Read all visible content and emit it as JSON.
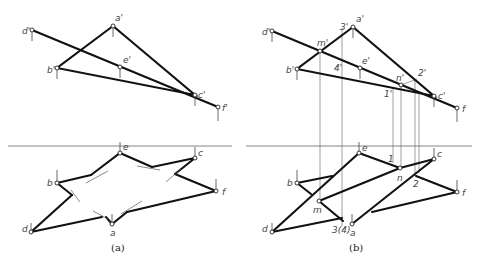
{
  "figure": {
    "panels": [
      {
        "id": "a",
        "caption": "(a)",
        "caption_pos": [
          120,
          250
        ],
        "divider": [
          8,
          146,
          232,
          146
        ],
        "top_view_label": "front",
        "points_top": {
          "d'": [
            32,
            30
          ],
          "a'": [
            113,
            26
          ],
          "b'": [
            57,
            68
          ],
          "e'": [
            120,
            67
          ],
          "c'": [
            195,
            95
          ],
          "f'": [
            218,
            107
          ]
        },
        "points_bottom": {
          "e": [
            120,
            153
          ],
          "c": [
            195,
            158
          ],
          "b": [
            57,
            183
          ],
          "f": [
            216,
            191
          ],
          "d": [
            31,
            232
          ],
          "a": [
            112,
            224
          ]
        },
        "labels_top": [
          {
            "text": "d'",
            "x": 22,
            "y": 34
          },
          {
            "text": "a'",
            "x": 115,
            "y": 21
          },
          {
            "text": "b'",
            "x": 47,
            "y": 73
          },
          {
            "text": "e'",
            "x": 123,
            "y": 63
          },
          {
            "text": "c'",
            "x": 198,
            "y": 98
          },
          {
            "text": "f'",
            "x": 222,
            "y": 111
          }
        ],
        "labels_bottom": [
          {
            "text": "e",
            "x": 123,
            "y": 150
          },
          {
            "text": "c",
            "x": 198,
            "y": 156
          },
          {
            "text": "b",
            "x": 47,
            "y": 186
          },
          {
            "text": "f",
            "x": 222,
            "y": 195
          },
          {
            "text": "d",
            "x": 22,
            "y": 232
          },
          {
            "text": "a",
            "x": 110,
            "y": 236
          }
        ]
      },
      {
        "id": "b",
        "caption": "(b)",
        "caption_pos": [
          358,
          250
        ],
        "divider": [
          246,
          146,
          472,
          146
        ],
        "points_top": {
          "d'": [
            272,
            31
          ],
          "a'": [
            353,
            27
          ],
          "m'": [
            320,
            51
          ],
          "b'": [
            297,
            69
          ],
          "e'": [
            360,
            68
          ],
          "n'": [
            401,
            85
          ],
          "c'": [
            434,
            96
          ],
          "f": [
            457,
            108
          ]
        },
        "points_bottom": {
          "e": [
            359,
            153
          ],
          "c": [
            434,
            159
          ],
          "b": [
            297,
            183
          ],
          "f": [
            457,
            192
          ],
          "d": [
            272,
            232
          ],
          "a": [
            352,
            224
          ],
          "m": [
            319,
            201
          ],
          "n": [
            400,
            168
          ]
        },
        "labels_top": [
          {
            "text": "d'",
            "x": 262,
            "y": 35
          },
          {
            "text": "3'",
            "x": 340,
            "y": 30
          },
          {
            "text": "a'",
            "x": 356,
            "y": 22
          },
          {
            "text": "m'",
            "x": 318,
            "y": 46
          },
          {
            "text": "b'",
            "x": 286,
            "y": 73
          },
          {
            "text": "4'",
            "x": 335,
            "y": 71
          },
          {
            "text": "e'",
            "x": 362,
            "y": 64
          },
          {
            "text": "n'",
            "x": 397,
            "y": 81
          },
          {
            "text": "2'",
            "x": 418,
            "y": 76
          },
          {
            "text": "1'",
            "x": 385,
            "y": 97
          },
          {
            "text": "c'",
            "x": 438,
            "y": 99
          },
          {
            "text": "f",
            "x": 462,
            "y": 112
          }
        ],
        "labels_bottom": [
          {
            "text": "e",
            "x": 362,
            "y": 151
          },
          {
            "text": "1",
            "x": 388,
            "y": 162
          },
          {
            "text": "c",
            "x": 437,
            "y": 157
          },
          {
            "text": "b",
            "x": 287,
            "y": 186
          },
          {
            "text": "n",
            "x": 398,
            "y": 181
          },
          {
            "text": "2",
            "x": 414,
            "y": 187
          },
          {
            "text": "f",
            "x": 462,
            "y": 196
          },
          {
            "text": "m",
            "x": 314,
            "y": 213
          },
          {
            "text": "d",
            "x": 262,
            "y": 232
          },
          {
            "text": "3(4)",
            "x": 333,
            "y": 233
          },
          {
            "text": "a",
            "x": 350,
            "y": 236
          }
        ]
      }
    ]
  }
}
